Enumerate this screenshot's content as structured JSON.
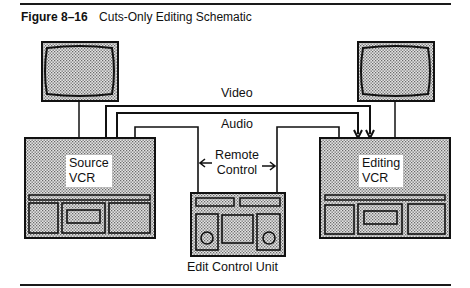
{
  "figure": {
    "number": "Figure 8–16",
    "title": "Cuts-Only Editing Schematic"
  },
  "diagram": {
    "nodes": [
      {
        "id": "source-monitor",
        "label": ""
      },
      {
        "id": "editing-monitor",
        "label": ""
      },
      {
        "id": "source-vcr",
        "label_line1": "Source",
        "label_line2": "VCR"
      },
      {
        "id": "editing-vcr",
        "label_line1": "Editing",
        "label_line2": "VCR"
      },
      {
        "id": "edit-control-unit",
        "label": "Edit Control Unit"
      }
    ],
    "connections": [
      {
        "from": "source-vcr",
        "to": "editing-vcr",
        "label": "Video",
        "arrow": "to"
      },
      {
        "from": "source-vcr",
        "to": "editing-vcr",
        "label": "Audio",
        "arrow": "to"
      },
      {
        "from": "edit-control-unit",
        "to": "source-vcr",
        "label": "Remote Control",
        "arrow": "to"
      },
      {
        "from": "edit-control-unit",
        "to": "editing-vcr",
        "label": "Remote Control",
        "arrow": "to"
      },
      {
        "from": "source-vcr",
        "to": "source-monitor",
        "label": ""
      },
      {
        "from": "editing-vcr",
        "to": "editing-monitor",
        "label": ""
      }
    ],
    "labels": {
      "video": "Video",
      "audio": "Audio",
      "remote_line1": "Remote",
      "remote_line2": "Control",
      "source_line1": "Source",
      "source_line2": "VCR",
      "editing_line1": "Editing",
      "editing_line2": "VCR",
      "control_unit": "Edit Control Unit"
    }
  }
}
